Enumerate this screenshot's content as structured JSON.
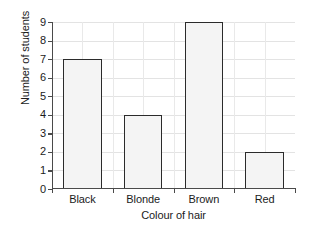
{
  "chart_data": {
    "type": "bar",
    "title": "",
    "categories": [
      "Black",
      "Blonde",
      "Brown",
      "Red"
    ],
    "values": [
      7,
      4,
      9,
      2
    ],
    "xlabel": "Colour of hair",
    "ylabel": "Number of students",
    "ylim": [
      0,
      9
    ],
    "ytick_labels": [
      "0",
      "1",
      "2",
      "3",
      "4",
      "5",
      "6",
      "7",
      "8",
      "9"
    ],
    "ytick_values": [
      0,
      1,
      2,
      3,
      4,
      5,
      6,
      7,
      8,
      9
    ],
    "grid": "both",
    "legend": "none",
    "colors": {
      "bar_fill": "#f4f4f4",
      "bar_edge": "#2b2b2b",
      "grid": "#e3e3e3",
      "axis": "#4a4a4a",
      "text": "#1b1b1b",
      "background": "#ffffff"
    }
  }
}
